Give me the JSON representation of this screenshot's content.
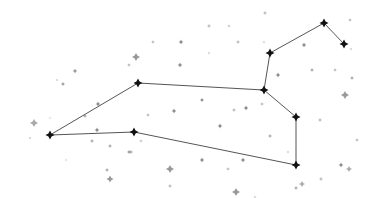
{
  "diagram": {
    "type": "constellation",
    "background": "#ffffff",
    "line_color": "#555555",
    "main_star_color": "#111111",
    "main_stars": [
      {
        "id": "A",
        "x": 50,
        "y": 135
      },
      {
        "id": "B",
        "x": 138,
        "y": 83
      },
      {
        "id": "C",
        "x": 134,
        "y": 132
      },
      {
        "id": "D",
        "x": 264,
        "y": 90
      },
      {
        "id": "E",
        "x": 270,
        "y": 53
      },
      {
        "id": "F",
        "x": 324,
        "y": 23
      },
      {
        "id": "G",
        "x": 344,
        "y": 44
      },
      {
        "id": "H",
        "x": 296,
        "y": 117
      },
      {
        "id": "I",
        "x": 296,
        "y": 165
      }
    ],
    "lines": [
      [
        "A",
        "B"
      ],
      [
        "B",
        "D"
      ],
      [
        "D",
        "E"
      ],
      [
        "E",
        "F"
      ],
      [
        "F",
        "G"
      ],
      [
        "D",
        "H"
      ],
      [
        "H",
        "I"
      ],
      [
        "I",
        "C"
      ],
      [
        "C",
        "A"
      ]
    ],
    "background_stars": [
      {
        "x": 75,
        "y": 71,
        "r": 1.2,
        "c": "#999"
      },
      {
        "x": 63,
        "y": 84,
        "r": 1.0,
        "c": "#999"
      },
      {
        "x": 57,
        "y": 80,
        "r": 0.8,
        "c": "#ccc"
      },
      {
        "x": 136,
        "y": 57,
        "r": 2.0,
        "c": "#999"
      },
      {
        "x": 129,
        "y": 65,
        "r": 0.9,
        "c": "#bbb"
      },
      {
        "x": 153,
        "y": 42,
        "r": 0.9,
        "c": "#bbb"
      },
      {
        "x": 181,
        "y": 42,
        "r": 1.2,
        "c": "#888"
      },
      {
        "x": 180,
        "y": 65,
        "r": 1.2,
        "c": "#888"
      },
      {
        "x": 209,
        "y": 26,
        "r": 1.0,
        "c": "#bbb"
      },
      {
        "x": 209,
        "y": 53,
        "r": 0.8,
        "c": "#ccc"
      },
      {
        "x": 265,
        "y": 13,
        "r": 1.0,
        "c": "#bbb"
      },
      {
        "x": 238,
        "y": 42,
        "r": 1.0,
        "c": "#bbb"
      },
      {
        "x": 264,
        "y": 42,
        "r": 0.8,
        "c": "#ccc"
      },
      {
        "x": 350,
        "y": 20,
        "r": 0.9,
        "c": "#bbb"
      },
      {
        "x": 351,
        "y": 49,
        "r": 0.8,
        "c": "#ccc"
      },
      {
        "x": 304,
        "y": 45,
        "r": 1.2,
        "c": "#888"
      },
      {
        "x": 229,
        "y": 26,
        "r": 0.8,
        "c": "#bbb"
      },
      {
        "x": 278,
        "y": 75,
        "r": 1.2,
        "c": "#888"
      },
      {
        "x": 312,
        "y": 70,
        "r": 1.0,
        "c": "#aaa"
      },
      {
        "x": 335,
        "y": 70,
        "r": 0.9,
        "c": "#bbb"
      },
      {
        "x": 352,
        "y": 78,
        "r": 1.0,
        "c": "#aaa"
      },
      {
        "x": 345,
        "y": 95,
        "r": 2.0,
        "c": "#999"
      },
      {
        "x": 320,
        "y": 120,
        "r": 1.0,
        "c": "#bbb"
      },
      {
        "x": 357,
        "y": 140,
        "r": 0.9,
        "c": "#bbb"
      },
      {
        "x": 341,
        "y": 165,
        "r": 1.2,
        "c": "#888"
      },
      {
        "x": 349,
        "y": 169,
        "r": 1.5,
        "c": "#aaa"
      },
      {
        "x": 321,
        "y": 179,
        "r": 1.0,
        "c": "#bbb"
      },
      {
        "x": 246,
        "y": 108,
        "r": 1.2,
        "c": "#888"
      },
      {
        "x": 220,
        "y": 126,
        "r": 1.2,
        "c": "#888"
      },
      {
        "x": 234,
        "y": 110,
        "r": 1.0,
        "c": "#bbb"
      },
      {
        "x": 262,
        "y": 104,
        "r": 0.9,
        "c": "#bbb"
      },
      {
        "x": 270,
        "y": 136,
        "r": 1.0,
        "c": "#aaa"
      },
      {
        "x": 288,
        "y": 152,
        "r": 0.8,
        "c": "#ccc"
      },
      {
        "x": 302,
        "y": 184,
        "r": 1.5,
        "c": "#aaa"
      },
      {
        "x": 296,
        "y": 188,
        "r": 1.0,
        "c": "#aaa"
      },
      {
        "x": 243,
        "y": 160,
        "r": 1.2,
        "c": "#888"
      },
      {
        "x": 202,
        "y": 160,
        "r": 1.2,
        "c": "#888"
      },
      {
        "x": 228,
        "y": 169,
        "r": 0.9,
        "c": "#bbb"
      },
      {
        "x": 236,
        "y": 192,
        "r": 2.0,
        "c": "#999"
      },
      {
        "x": 255,
        "y": 197,
        "r": 0.8,
        "c": "#ccc"
      },
      {
        "x": 202,
        "y": 100,
        "r": 1.0,
        "c": "#888"
      },
      {
        "x": 174,
        "y": 111,
        "r": 1.2,
        "c": "#888"
      },
      {
        "x": 98,
        "y": 104,
        "r": 1.2,
        "c": "#888"
      },
      {
        "x": 85,
        "y": 116,
        "r": 1.0,
        "c": "#aaa"
      },
      {
        "x": 97,
        "y": 130,
        "r": 1.2,
        "c": "#888"
      },
      {
        "x": 92,
        "y": 141,
        "r": 1.0,
        "c": "#aaa"
      },
      {
        "x": 110,
        "y": 146,
        "r": 1.0,
        "c": "#aaa"
      },
      {
        "x": 131,
        "y": 152,
        "r": 1.0,
        "c": "#aaa"
      },
      {
        "x": 141,
        "y": 141,
        "r": 0.9,
        "c": "#ccc"
      },
      {
        "x": 34,
        "y": 123,
        "r": 2.0,
        "c": "#aaa"
      },
      {
        "x": 30,
        "y": 138,
        "r": 0.8,
        "c": "#ccc"
      },
      {
        "x": 50,
        "y": 118,
        "r": 0.8,
        "c": "#ddd"
      },
      {
        "x": 66,
        "y": 160,
        "r": 0.8,
        "c": "#ddd"
      },
      {
        "x": 107,
        "y": 170,
        "r": 1.0,
        "c": "#aaa"
      },
      {
        "x": 110,
        "y": 179,
        "r": 1.8,
        "c": "#999"
      },
      {
        "x": 170,
        "y": 169,
        "r": 2.0,
        "c": "#999"
      },
      {
        "x": 170,
        "y": 186,
        "r": 1.0,
        "c": "#bbb"
      },
      {
        "x": 129,
        "y": 152,
        "r": 1.0,
        "c": "#999"
      },
      {
        "x": 148,
        "y": 115,
        "r": 0.9,
        "c": "#bbb"
      }
    ]
  }
}
